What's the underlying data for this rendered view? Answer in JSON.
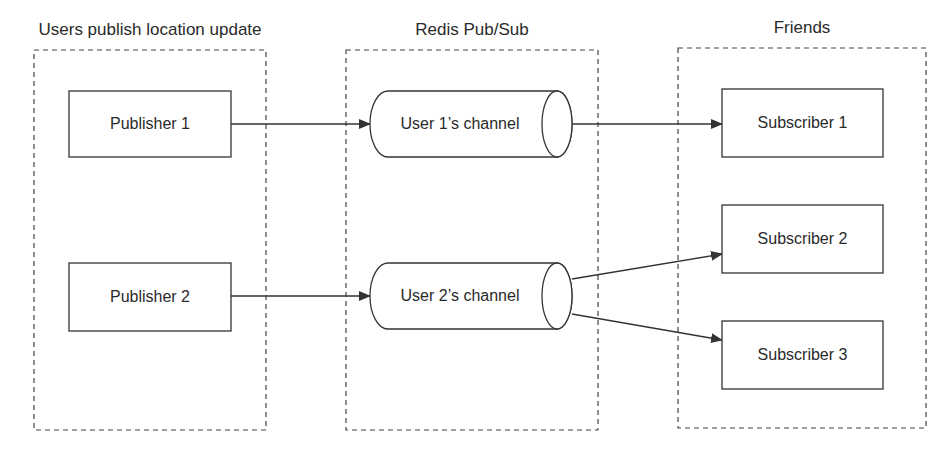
{
  "diagram": {
    "type": "flow",
    "groups": [
      {
        "id": "publishers",
        "title": "Users publish location update",
        "x": 34,
        "y": 50,
        "w": 232,
        "h": 380
      },
      {
        "id": "redis",
        "title": "Redis Pub/Sub",
        "x": 346,
        "y": 50,
        "w": 252,
        "h": 380
      },
      {
        "id": "friends",
        "title": "Friends",
        "x": 678,
        "y": 48,
        "w": 248,
        "h": 380
      }
    ],
    "nodes": [
      {
        "id": "pub1",
        "label": "Publisher 1",
        "shape": "rect",
        "x": 69,
        "y": 91,
        "w": 162,
        "h": 66
      },
      {
        "id": "pub2",
        "label": "Publisher 2",
        "shape": "rect",
        "x": 69,
        "y": 263,
        "w": 162,
        "h": 68
      },
      {
        "id": "ch1",
        "label": "User 1’s channel",
        "shape": "cylinder",
        "x": 370,
        "y": 91,
        "w": 202,
        "h": 66
      },
      {
        "id": "ch2",
        "label": "User 2’s channel",
        "shape": "cylinder",
        "x": 370,
        "y": 263,
        "w": 202,
        "h": 66
      },
      {
        "id": "sub1",
        "label": "Subscriber 1",
        "shape": "rect",
        "x": 722,
        "y": 89,
        "w": 161,
        "h": 68
      },
      {
        "id": "sub2",
        "label": "Subscriber 2",
        "shape": "rect",
        "x": 722,
        "y": 205,
        "w": 161,
        "h": 68
      },
      {
        "id": "sub3",
        "label": "Subscriber 3",
        "shape": "rect",
        "x": 722,
        "y": 321,
        "w": 161,
        "h": 68
      }
    ],
    "edges": [
      {
        "from": "pub1",
        "to": "ch1",
        "x1": 231,
        "y1": 124,
        "x2": 370,
        "y2": 124
      },
      {
        "from": "pub2",
        "to": "ch2",
        "x1": 231,
        "y1": 296,
        "x2": 370,
        "y2": 296
      },
      {
        "from": "ch1",
        "to": "sub1",
        "x1": 572,
        "y1": 124,
        "x2": 722,
        "y2": 124
      },
      {
        "from": "ch2",
        "to": "sub2",
        "x1": 572,
        "y1": 279,
        "x2": 722,
        "y2": 254
      },
      {
        "from": "ch2",
        "to": "sub3",
        "x1": 572,
        "y1": 314,
        "x2": 722,
        "y2": 340
      }
    ],
    "colors": {
      "stroke": "#333333",
      "text": "#2a2a2a",
      "background": "#ffffff"
    }
  }
}
